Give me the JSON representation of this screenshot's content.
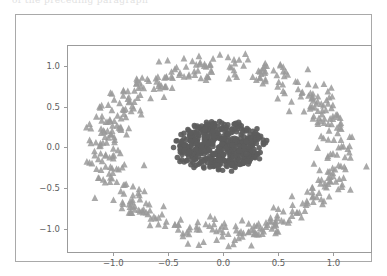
{
  "figure": {
    "bleed_text": "of the preceding paragraph",
    "background_color": "#ffffff",
    "frame_color": "#a9a9a9",
    "axes_color": "#9b9b9b"
  },
  "chart_data": {
    "type": "scatter",
    "title": "",
    "xlabel": "",
    "ylabel": "",
    "xlim": [
      -1.42,
      1.35
    ],
    "ylim": [
      -1.3,
      1.26
    ],
    "grid": false,
    "legend": null,
    "xticks": [
      -1.0,
      -0.5,
      0.0,
      0.5,
      1.0
    ],
    "xtick_labels": [
      "−1.0",
      "−0.5",
      "0.0",
      "0.5",
      "1.0"
    ],
    "yticks": [
      -1.0,
      -0.5,
      0.0,
      0.5,
      1.0
    ],
    "ytick_labels": [
      "−1.0",
      "−0.5",
      "0.0",
      "0.5",
      "1.0"
    ],
    "series": [
      {
        "name": "outer-ring",
        "marker": "triangle",
        "color": "#9a9a9a",
        "marker_size": 3.4,
        "n_points": 500,
        "shape": "ring",
        "radius_x": 1.07,
        "radius_y": 1.02,
        "radius_noise": 0.085,
        "center": [
          -0.02,
          -0.02
        ],
        "seed": 20731
      },
      {
        "name": "inner-cluster",
        "marker": "circle",
        "color": "#5c5c5c",
        "marker_size": 4.0,
        "n_points": 500,
        "shape": "blob",
        "radius_x": 0.4,
        "radius_y": 0.3,
        "radius_noise": 0.04,
        "center": [
          -0.03,
          0.02
        ],
        "seed": 90415
      }
    ]
  }
}
